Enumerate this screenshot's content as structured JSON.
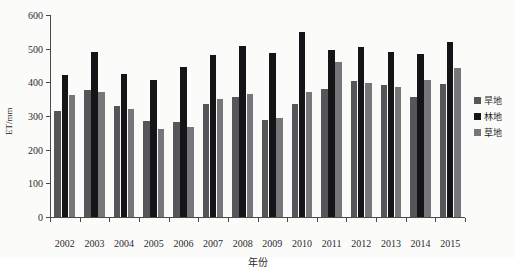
{
  "chart_data": {
    "type": "bar",
    "title": "",
    "xlabel": "年份",
    "ylabel": "ET/mm",
    "ylim": [
      0,
      600
    ],
    "yticks": [
      0,
      100,
      200,
      300,
      400,
      500,
      600
    ],
    "grid": false,
    "legend_position": "right",
    "categories": [
      "2002",
      "2003",
      "2004",
      "2005",
      "2006",
      "2007",
      "2008",
      "2009",
      "2010",
      "2011",
      "2012",
      "2013",
      "2014",
      "2015"
    ],
    "series": [
      {
        "name": "旱地",
        "color": "#56565a",
        "values": [
          315,
          377,
          331,
          285,
          281,
          335,
          356,
          289,
          335,
          380,
          403,
          391,
          356,
          396
        ]
      },
      {
        "name": "林地",
        "color": "#151517",
        "values": [
          422,
          489,
          426,
          408,
          446,
          481,
          508,
          486,
          551,
          496,
          504,
          491,
          484,
          521
        ]
      },
      {
        "name": "草地",
        "color": "#77777b",
        "values": [
          362,
          371,
          321,
          260,
          266,
          350,
          365,
          293,
          371,
          459,
          399,
          387,
          407,
          444
        ]
      }
    ]
  }
}
